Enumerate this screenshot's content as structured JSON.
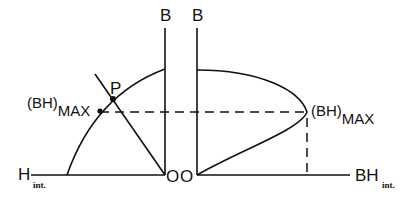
{
  "diagram": {
    "left_panel": {
      "vertical_axis_label": "B",
      "horizontal_axis_label": "H",
      "horizontal_axis_subscript": "int.",
      "origin_label": "O",
      "point_label": "P",
      "max_label_main": "(BH)",
      "max_label_subscript": "MAX"
    },
    "right_panel": {
      "vertical_axis_label": "B",
      "horizontal_axis_label": "BH",
      "horizontal_axis_subscript": "int.",
      "origin_label": "O",
      "max_label_main": "(BH)",
      "max_label_subscript": "MAX"
    },
    "colors": {
      "line": "#111111",
      "background": "#ffffff"
    }
  }
}
